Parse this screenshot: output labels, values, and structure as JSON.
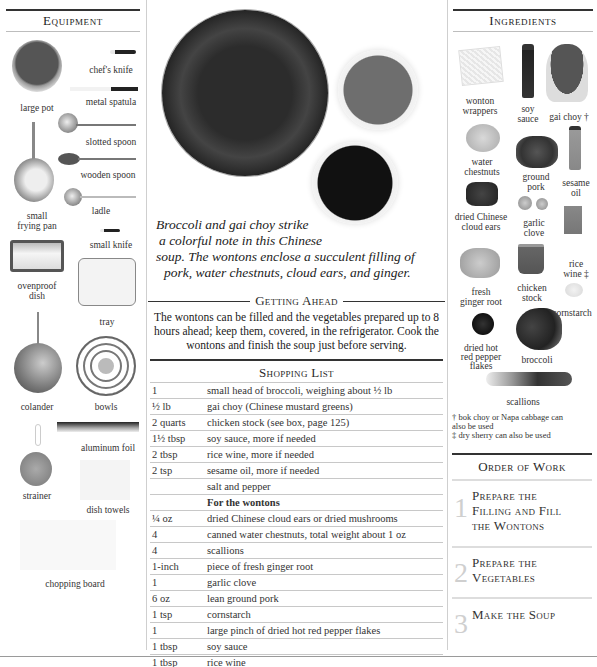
{
  "equipment": {
    "title": "Equipment",
    "items": [
      {
        "name": "large pot"
      },
      {
        "name": "chef's knife"
      },
      {
        "name": "metal spatula"
      },
      {
        "name": "slotted spoon"
      },
      {
        "name": "wooden spoon"
      },
      {
        "name": "ladle"
      },
      {
        "name": "small",
        "name2": "frying pan"
      },
      {
        "name": "small knife"
      },
      {
        "name": "ovenproof",
        "name2": "dish"
      },
      {
        "name": "tray"
      },
      {
        "name": "colander"
      },
      {
        "name": "bowls"
      },
      {
        "name": "aluminum foil"
      },
      {
        "name": "strainer"
      },
      {
        "name": "dish towels"
      },
      {
        "name": "chopping board"
      }
    ]
  },
  "main": {
    "caption_lines": [
      "Broccoli and gai choy strike",
      "a colorful note in this Chinese",
      "soup. The wontons enclose a succulent filling of",
      "pork, water chestnuts, cloud ears, and ginger."
    ],
    "getting_ahead": {
      "title": "Getting Ahead",
      "body": "The wontons can be filled and the vegetables prepared up to 8 hours ahead; keep them, covered, in the refrigerator. Cook the wontons and finish the soup just before serving."
    },
    "shopping_list": {
      "title": "Shopping List",
      "rows": [
        {
          "qty": "1",
          "item": "small head of broccoli, weighing about ½ lb"
        },
        {
          "qty": "½ lb",
          "item": "gai choy (Chinese mustard greens)"
        },
        {
          "qty": "2 quarts",
          "item": "chicken stock (see box, page 125)"
        },
        {
          "qty": "1½ tbsp",
          "item": "soy sauce, more if needed"
        },
        {
          "qty": "2 tbsp",
          "item": "rice wine, more if needed"
        },
        {
          "qty": "2 tsp",
          "item": "sesame oil, more if needed"
        },
        {
          "qty": "",
          "item": "salt and pepper"
        },
        {
          "qty": "",
          "item": "For the wontons",
          "subheading": true
        },
        {
          "qty": "¼ oz",
          "item": "dried Chinese cloud ears or dried mushrooms"
        },
        {
          "qty": "4",
          "item": "canned water chestnuts, total weight about 1 oz"
        },
        {
          "qty": "4",
          "item": "scallions"
        },
        {
          "qty": "1-inch",
          "item": "piece of fresh ginger root"
        },
        {
          "qty": "1",
          "item": "garlic clove"
        },
        {
          "qty": "6 oz",
          "item": "lean ground pork"
        },
        {
          "qty": "1 tsp",
          "item": "cornstarch"
        },
        {
          "qty": "1",
          "item": "large pinch of dried hot red pepper flakes"
        },
        {
          "qty": "1 tbsp",
          "item": "soy sauce"
        },
        {
          "qty": "1 tbsp",
          "item": "rice wine"
        },
        {
          "qty": "32",
          "item": "wonton wrappers, total weight about 4 oz"
        }
      ]
    }
  },
  "ingredients": {
    "title": "Ingredients",
    "items": [
      {
        "l1": "wonton",
        "l2": "wrappers"
      },
      {
        "l1": "soy",
        "l2": "sauce"
      },
      {
        "l1": "gai choy †",
        "l2": ""
      },
      {
        "l1": "water",
        "l2": "chestnuts"
      },
      {
        "l1": "ground",
        "l2": "pork"
      },
      {
        "l1": "sesame",
        "l2": "oil"
      },
      {
        "l1": "dried Chinese",
        "l2": "cloud ears"
      },
      {
        "l1": "garlic",
        "l2": "clove"
      },
      {
        "l1": "rice",
        "l2": "wine ‡"
      },
      {
        "l1": "fresh",
        "l2": "ginger root"
      },
      {
        "l1": "chicken",
        "l2": "stock"
      },
      {
        "l1": "cornstarch",
        "l2": ""
      },
      {
        "l1": "dried hot",
        "l2": "red pepper",
        "l3": "flakes"
      },
      {
        "l1": "broccoli",
        "l2": ""
      },
      {
        "l1": "scallions",
        "l2": ""
      }
    ],
    "notes": [
      "† bok choy or Napa cabbage can",
      "also be used",
      "‡ dry sherry can also be used"
    ]
  },
  "order_of_work": {
    "title": "Order of Work",
    "steps": [
      {
        "num": "1",
        "l1": "Prepare the",
        "l2": "Filling and Fill",
        "l3": "the Wontons"
      },
      {
        "num": "2",
        "l1": "Prepare the",
        "l2": "Vegetables"
      },
      {
        "num": "3",
        "l1": "Make the Soup"
      }
    ]
  },
  "colors": {
    "text": "#2a2a2a",
    "rule": "#333333",
    "light_rule": "#c8c8c8",
    "step_number": "#cfcfcf"
  }
}
